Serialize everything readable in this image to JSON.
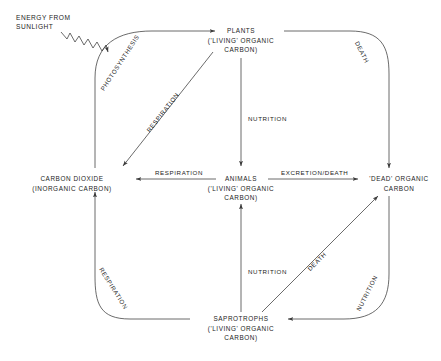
{
  "figure": {
    "kind": "carbon-cycle-flow-diagram",
    "background_color": "#ffffff",
    "line_color": "#3a3a3a",
    "text_color": "#1d1d1d"
  },
  "source": {
    "line1": "ENERGY FROM",
    "line2": "SUNLIGHT"
  },
  "nodes": {
    "plants": {
      "title": "PLANTS",
      "sub1": "('LIVING' ORGANIC",
      "sub2": "CARBON)"
    },
    "carbon_dioxide": {
      "title": "CARBON DIOXIDE",
      "sub1": "(INORGANIC CARBON)",
      "sub2": ""
    },
    "animals": {
      "title": "ANIMALS",
      "sub1": "('LIVING' ORGANIC",
      "sub2": "CARBON)"
    },
    "dead_organic": {
      "title": "'DEAD' ORGANIC",
      "sub1": "CARBON",
      "sub2": ""
    },
    "saprotrophs": {
      "title": "SAPROTROPHS",
      "sub1": "('LIVING' ORGANIC",
      "sub2": "CARBON)"
    }
  },
  "edges": {
    "photosynthesis": "PHOTOSYNTHESIS",
    "respiration_plants_to_co2": "RESPIRATION",
    "death_plants_to_dead": "DEATH",
    "nutrition_plants_to_animals": "NUTRITION",
    "respiration_animals_to_co2": "RESPIRATION",
    "excretion_death_animals_to_dead": "EXCRETION/DEATH",
    "nutrition_saprotrophs_to_animals": "NUTRITION",
    "death_saprotrophs_to_dead": "DEATH",
    "respiration_saprotrophs_to_co2": "RESPIRATION",
    "nutrition_dead_to_saprotrophs": "NUTRITION"
  }
}
